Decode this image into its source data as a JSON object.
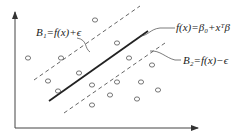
{
  "diagram": {
    "type": "svr-epsilon-tube",
    "colors": {
      "line": "#222222",
      "dashed": "#555555",
      "axis": "#444444",
      "point": "#555555",
      "background": "#ffffff"
    },
    "labels": {
      "upper_boundary": "B₁=f(x)+ϵ",
      "regression": "f(x)=β₀+xᵀβ",
      "lower_boundary": "B₂=f(x)−ϵ"
    },
    "axes": {
      "x_axis": {
        "from": [
          15,
          128
        ],
        "to": [
          198,
          128
        ]
      },
      "y_axis": {
        "from": [
          15,
          128
        ],
        "to": [
          15,
          12
        ]
      }
    },
    "lines": {
      "regression": {
        "from": [
          49,
          101
        ],
        "to": [
          148,
          31
        ],
        "style": "solid"
      },
      "upper_boundary": {
        "from": [
          34,
          80
        ],
        "to": [
          140,
          6
        ],
        "style": "dashed"
      },
      "lower_boundary": {
        "from": [
          64,
          113
        ],
        "to": [
          165,
          43
        ],
        "style": "dashed"
      }
    },
    "points": [
      [
        28,
        58
      ],
      [
        61,
        58
      ],
      [
        95,
        20
      ],
      [
        117,
        43
      ],
      [
        48,
        81
      ],
      [
        58,
        91
      ],
      [
        79,
        73
      ],
      [
        92,
        85
      ],
      [
        92,
        105
      ],
      [
        110,
        95
      ],
      [
        117,
        82
      ],
      [
        129,
        58
      ],
      [
        137,
        99
      ],
      [
        141,
        82
      ],
      [
        152,
        65
      ],
      [
        158,
        90
      ]
    ]
  }
}
